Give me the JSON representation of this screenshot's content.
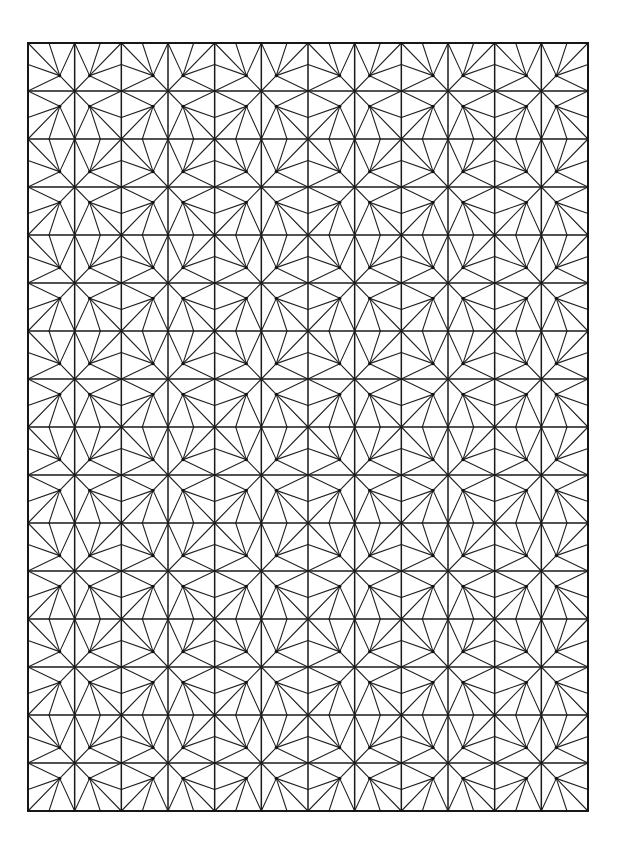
{
  "artwork": {
    "description": "Geometric line-art pattern: rectangular grid of cells, each cell subdivided by a fan of lines radiating from an interior hub point; cells grouped in mirror-symmetric 2x2 blocks",
    "background_color": "#ffffff",
    "line_color": "#1a1a1a",
    "frame": {
      "x0": 28,
      "y0": 43,
      "x1": 588,
      "y1": 811
    },
    "grid": {
      "cols": 12,
      "rows": 16
    },
    "motif": {
      "block_size_cells": 2,
      "hub_fraction_toward_block_center": 0.68,
      "outer_edge_point_fraction": 0.45,
      "hub_dot_radius": 1.6
    }
  }
}
